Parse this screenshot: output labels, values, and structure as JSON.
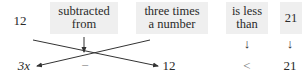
{
  "top_row": {
    "item1": "12",
    "item2_line1": "subtracted",
    "item2_line2": "from",
    "item3_line1": "three times",
    "item3_line2": "a number",
    "item4_line1": "is less",
    "item4_line2": "than",
    "item5": "21"
  },
  "bottom_row": {
    "item1": "3x",
    "item2": "−",
    "item3": "12",
    "item4": "<",
    "item5": "21"
  },
  "arrows": {
    "down_arrow": "↓"
  },
  "colors": {
    "box_background": "#efefef",
    "text": "#2a2a2a",
    "lines": "#333333"
  }
}
